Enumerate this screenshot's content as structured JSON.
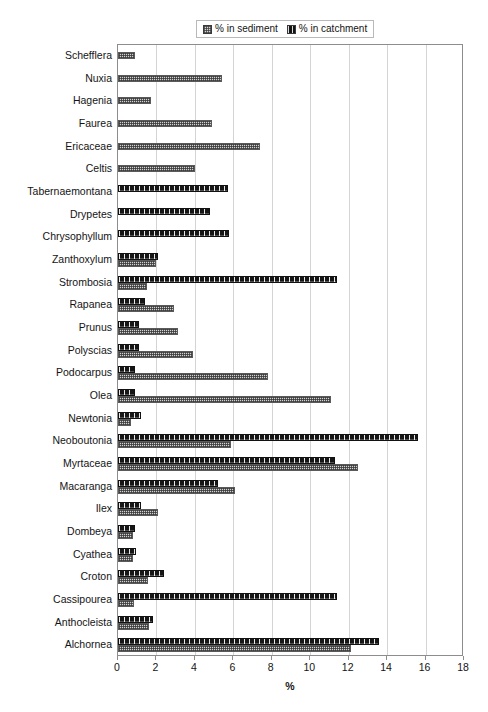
{
  "legend": {
    "entries": [
      {
        "label": "% in sediment",
        "swatch": "sediment-swatch"
      },
      {
        "label": "% in catchment",
        "swatch": "catchment-swatch"
      }
    ]
  },
  "axis": {
    "x_title": "%",
    "x_ticks": [
      "0",
      "2",
      "4",
      "6",
      "8",
      "10",
      "12",
      "14",
      "16",
      "18"
    ]
  },
  "chart_data": {
    "type": "bar",
    "orientation": "horizontal",
    "title": "",
    "xlabel": "%",
    "ylabel": "",
    "xlim": [
      0,
      18
    ],
    "xticks": [
      0,
      2,
      4,
      6,
      8,
      10,
      12,
      14,
      16,
      18
    ],
    "grid": true,
    "legend_position": "top",
    "categories": [
      "Schefflera",
      "Nuxia",
      "Hagenia",
      "Faurea",
      "Ericaceae",
      "Celtis",
      "Tabernaemontana",
      "Drypetes",
      "Chrysophyllum",
      "Zanthoxylum",
      "Strombosia",
      "Rapanea",
      "Prunus",
      "Polyscias",
      "Podocarpus",
      "Olea",
      "Newtonia",
      "Neoboutonia",
      "Myrtaceae",
      "Macaranga",
      "Ilex",
      "Dombeya",
      "Cyathea",
      "Croton",
      "Cassipourea",
      "Anthocleista",
      "Alchornea"
    ],
    "series": [
      {
        "name": "% in sediment",
        "values": [
          0.9,
          5.4,
          1.7,
          4.9,
          7.4,
          4.0,
          0,
          0,
          0,
          2.0,
          1.5,
          2.9,
          3.1,
          3.9,
          7.8,
          11.1,
          0.7,
          5.9,
          12.5,
          6.1,
          2.1,
          0.8,
          0.8,
          1.55,
          0.85,
          1.6,
          12.1
        ]
      },
      {
        "name": "% in catchment",
        "values": [
          0,
          0,
          0,
          0,
          0,
          0,
          5.7,
          4.8,
          5.8,
          2.1,
          11.4,
          1.4,
          1.1,
          1.1,
          0.9,
          0.9,
          1.2,
          15.6,
          11.3,
          5.2,
          1.2,
          0.9,
          0.95,
          2.4,
          11.4,
          1.8,
          13.6
        ]
      }
    ]
  }
}
